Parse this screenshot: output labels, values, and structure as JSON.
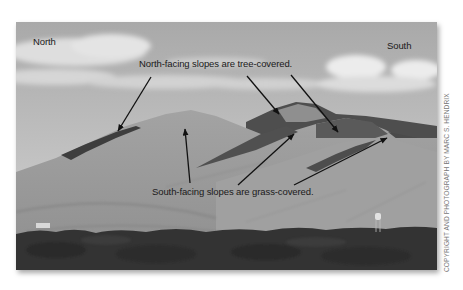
{
  "figure": {
    "labels": {
      "north": "North",
      "south": "South",
      "north_facing_caption": "North-facing slopes are tree-covered.",
      "south_facing_caption": "South-facing slopes are grass-covered."
    },
    "credit": "COPYRIGHT AND PHOTOGRAPH BY MARC S. HENDRIX",
    "arrows": {
      "north_facing": [
        {
          "from": [
            151,
            77
          ],
          "to": [
            118,
            131
          ]
        },
        {
          "from": [
            247,
            76
          ],
          "to": [
            279,
            114
          ]
        },
        {
          "from": [
            291,
            75
          ],
          "to": [
            338,
            132
          ]
        }
      ],
      "south_facing": [
        {
          "from": [
            190,
            183
          ],
          "to": [
            185,
            129
          ]
        },
        {
          "from": [
            238,
            185
          ],
          "to": [
            294,
            134
          ]
        },
        {
          "from": [
            294,
            185
          ],
          "to": [
            387,
            138
          ]
        }
      ]
    },
    "colors": {
      "sky": "#bdbdbd",
      "cloud": "#e6e6e6",
      "grass_slope": "#9a9a9a",
      "tree_slope": "#4a4a4a",
      "foreground_trees": "#2e2e2e",
      "arrow": "#111111",
      "text": "#1a1a1a"
    }
  }
}
